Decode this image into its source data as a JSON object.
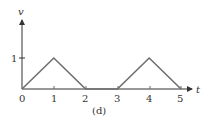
{
  "chart_data": {
    "type": "line",
    "title": "",
    "caption": "(d)",
    "xlabel": "t",
    "ylabel": "v",
    "x": [
      0,
      1,
      2,
      3,
      4,
      5
    ],
    "series": [
      {
        "name": "v(t)",
        "values": [
          0,
          1,
          0,
          0,
          1,
          0
        ]
      }
    ],
    "xticks": [
      "0",
      "1",
      "2",
      "3",
      "4",
      "5"
    ],
    "yticks": [
      "1"
    ],
    "xlim": [
      0,
      5.3
    ],
    "ylim": [
      0,
      2.2
    ],
    "grid": false,
    "legend": null,
    "line_color": "#6e6e6e",
    "axis_color": "#333333"
  }
}
